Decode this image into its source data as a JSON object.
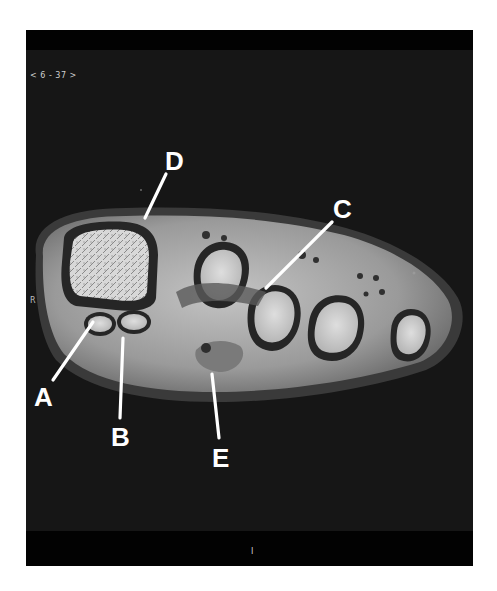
{
  "viewer": {
    "slice_indicator": "< 6 - 37 >",
    "orientation_marker": "R",
    "bottom_marker": "I"
  },
  "figure": {
    "labels": [
      {
        "id": "A",
        "text": "A"
      },
      {
        "id": "B",
        "text": "B"
      },
      {
        "id": "C",
        "text": "C"
      },
      {
        "id": "D",
        "text": "D"
      },
      {
        "id": "E",
        "text": "E"
      }
    ]
  },
  "colors": {
    "background": "#161616",
    "bars": "#020202",
    "label": "#ffffff",
    "soft_tissue": "#a9a9a9",
    "bone_marrow": "#d4d4d4",
    "cortex": "#2a2a2a"
  }
}
